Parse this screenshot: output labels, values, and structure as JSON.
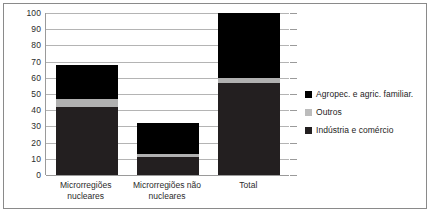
{
  "chart_data": {
    "type": "bar",
    "subtype": "stacked-bar",
    "title": "",
    "subtitle": "",
    "xlabel": "",
    "ylabel": "",
    "ylim": [
      0,
      100
    ],
    "yticks": [
      0,
      10,
      20,
      30,
      40,
      50,
      60,
      70,
      80,
      90,
      100
    ],
    "ytick_labels": [
      "0",
      "10",
      "20",
      "30",
      "40",
      "50",
      "60",
      "70",
      "80",
      "90",
      "100"
    ],
    "grid": true,
    "grid_axis": "y",
    "legend_position": "right",
    "categories": [
      "Microrregiões\nnucleares",
      "Microrregiões não\nnucleares",
      "Total"
    ],
    "series": [
      {
        "name": "Indústria e comércio",
        "color": "#231f20",
        "values": [
          42,
          11,
          57
        ]
      },
      {
        "name": "Outros",
        "color": "#b0b0b0",
        "values": [
          5,
          2,
          3
        ]
      },
      {
        "name": "Agropec. e agric. familiar.",
        "color": "#000000",
        "values": [
          21,
          19,
          40
        ]
      }
    ],
    "stack_order_bottom_to_top": [
      "Indústria e comércio",
      "Outros",
      "Agropec. e agric. familiar."
    ],
    "bar_tops": [
      68,
      32,
      100
    ]
  },
  "legend": {
    "items": [
      {
        "label": "Agropec. e agric. familiar.",
        "color": "#000000",
        "swatch": "legend-swatch-black"
      },
      {
        "label": "Outros",
        "color": "#bcbcbc",
        "swatch": "legend-swatch-gray"
      },
      {
        "label": "Indústria e comércio",
        "color": "#231f20",
        "swatch": "legend-swatch-dark"
      }
    ]
  },
  "axis": {
    "y_labels": [
      "100",
      "90",
      "80",
      "70",
      "60",
      "50",
      "40",
      "30",
      "20",
      "10",
      "0"
    ],
    "x_labels": [
      "Microrregiões\nnucleares",
      "Microrregiões não\nnucleares",
      "Total"
    ]
  },
  "colors": {
    "frame": "#8a8a8a",
    "gridline": "#b4b4b4",
    "axis": "#9a9a9a",
    "agropec": "#000000",
    "outros": "#b0b0b0",
    "industria": "#231f20",
    "text": "#2b2b2b",
    "background": "#ffffff"
  }
}
